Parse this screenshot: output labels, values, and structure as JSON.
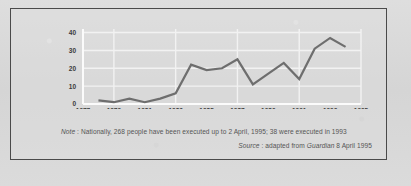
{
  "figure": {
    "note_prefix": "Note",
    "note_sep": " : ",
    "note_text": "Nationally, 268 people have been executed up to 2 April, 1995; 38 were executed in 1993",
    "source_prefix": "Source",
    "source_sep": " : ",
    "source_text_pre": "adapted from ",
    "source_publication": "Guardian",
    "source_text_post": " 8 April 1995"
  },
  "style": {
    "line_color": "#6e6e6e",
    "grid_color": "#f2f2f2",
    "axis_color": "#fbfbfb",
    "frame_color": "#4a4a4a",
    "background": "#d9d9d9",
    "text_color": "#3a3a3a"
  },
  "chart_data": {
    "type": "line",
    "title": "",
    "subtitle": "",
    "xlabel": "",
    "ylabel": "",
    "xlim": [
      1977,
      1995
    ],
    "ylim": [
      0,
      42
    ],
    "grid": true,
    "legend": "none",
    "yticks": [
      0,
      10,
      20,
      30,
      40
    ],
    "ytick_labels": [
      "0",
      "10",
      "20",
      "30",
      "40"
    ],
    "xticks": [
      1977,
      1979,
      1981,
      1983,
      1985,
      1987,
      1989,
      1991,
      1993,
      1995
    ],
    "xtick_labels": [
      "1977",
      "1979",
      "1981",
      "1983",
      "1985",
      "1987",
      "1989",
      "1991",
      "1993",
      "1995"
    ],
    "series": [
      {
        "name": "Executions",
        "x": [
          1978,
          1979,
          1980,
          1981,
          1982,
          1983,
          1984,
          1985,
          1986,
          1987,
          1988,
          1989,
          1990,
          1991,
          1992,
          1993,
          1994
        ],
        "values": [
          2,
          1,
          3,
          1,
          3,
          6,
          22,
          19,
          20,
          25,
          11,
          17,
          23,
          14,
          31,
          37,
          32
        ]
      }
    ]
  }
}
